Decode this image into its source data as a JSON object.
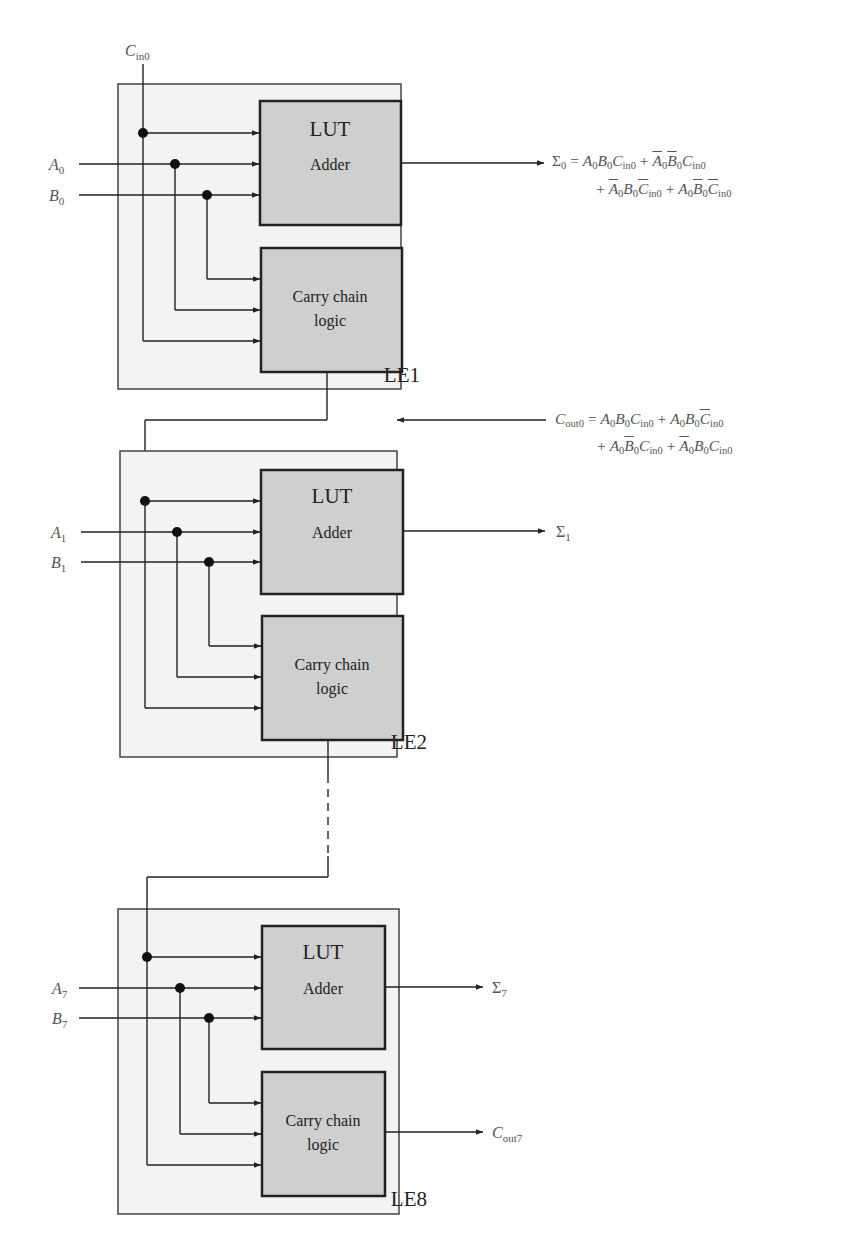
{
  "figure": {
    "carry_in_label": {
      "main": "C",
      "sub": "in0"
    },
    "blocks": [
      {
        "id": "LE1",
        "label": "LE1",
        "inputs": [
          {
            "main": "A",
            "sub": "0"
          },
          {
            "main": "B",
            "sub": "0"
          }
        ],
        "sum_output": {
          "main": "Σ",
          "sub": "0"
        },
        "carry_output": null
      },
      {
        "id": "LE2",
        "label": "LE2",
        "inputs": [
          {
            "main": "A",
            "sub": "1"
          },
          {
            "main": "B",
            "sub": "1"
          }
        ],
        "sum_output": {
          "main": "Σ",
          "sub": "1"
        },
        "carry_output": null
      },
      {
        "id": "LE8",
        "label": "LE8",
        "inputs": [
          {
            "main": "A",
            "sub": "7"
          },
          {
            "main": "B",
            "sub": "7"
          }
        ],
        "sum_output": {
          "main": "Σ",
          "sub": "7"
        },
        "carry_output": {
          "main": "C",
          "sub": "out7"
        }
      }
    ],
    "lut_block": {
      "title": "LUT",
      "subtitle": "Adder"
    },
    "carry_block": {
      "line1": "Carry chain",
      "line2": "logic"
    },
    "equations": {
      "sum0": {
        "lhs": "Σ0",
        "line1": "A0B0Cin0 + Ā0B̄0Cin0",
        "line2": "+ Ā0B0C̄in0 + A0B̄0C̄in0"
      },
      "cout0": {
        "lhs": "Cout0",
        "line1": "A0B0Cin0 + A0B0C̄in0",
        "line2": "+ A0B̄0Cin0 + Ā0B0Cin0"
      }
    },
    "colors": {
      "frame_fill": "#f3f3f3",
      "block_fill": "#cfcfcf",
      "line": "#222222"
    }
  }
}
